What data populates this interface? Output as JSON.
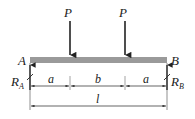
{
  "diagram": {
    "type": "simply-supported-beam",
    "beam_color": "#9a9a9a",
    "line_color": "#222222",
    "supports": {
      "left": {
        "point_label": "A",
        "reaction_label": "R",
        "reaction_sub": "A"
      },
      "right": {
        "point_label": "B",
        "reaction_label": "R",
        "reaction_sub": "B"
      }
    },
    "loads": [
      {
        "label": "P"
      },
      {
        "label": "P"
      }
    ],
    "dimensions": {
      "segments": [
        {
          "label": "a"
        },
        {
          "label": "b"
        },
        {
          "label": "a"
        }
      ],
      "total": {
        "label": "l"
      }
    }
  }
}
